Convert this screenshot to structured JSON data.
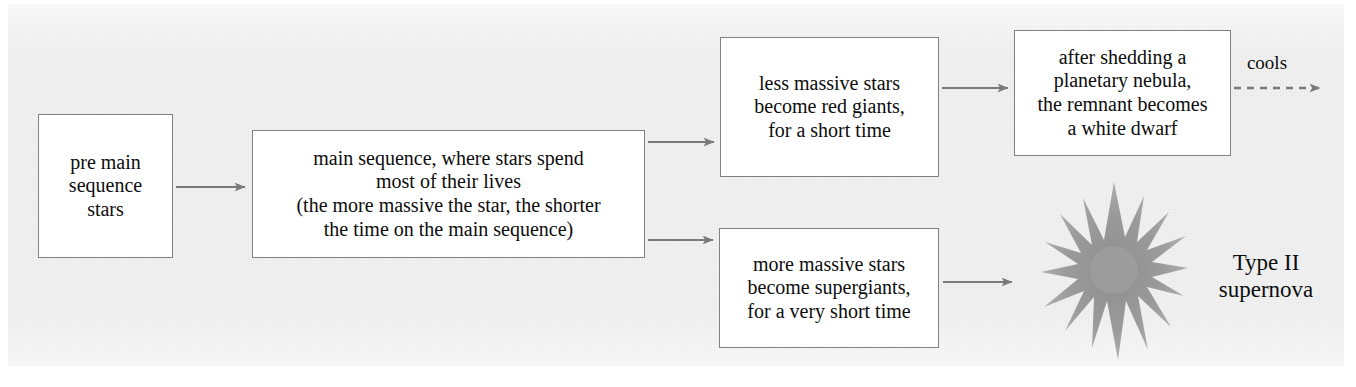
{
  "diagram": {
    "background_color": "#f0f0f0",
    "box_fill": "#ffffff",
    "box_border_color": "#808080",
    "arrow_color": "#7a7a7a",
    "starburst_color": "#9a9a9a",
    "text_color": "#0d0d0d",
    "nodes": [
      {
        "id": "pre-main-sequence",
        "text": "pre main\nsequence\nstars"
      },
      {
        "id": "main-sequence",
        "text": "main sequence, where stars spend\nmost of their lives\n(the more massive the star, the shorter\nthe time on the main sequence)"
      },
      {
        "id": "red-giants",
        "text": "less massive stars\nbecome red giants,\nfor a short time"
      },
      {
        "id": "white-dwarf",
        "text": "after shedding a\nplanetary nebula,\nthe remnant becomes\na white dwarf"
      },
      {
        "id": "supergiants",
        "text": "more massive stars\nbecome supergiants,\nfor a very short time"
      }
    ],
    "labels": {
      "cools": "cools",
      "supernova": "Type II\nsupernova"
    }
  }
}
